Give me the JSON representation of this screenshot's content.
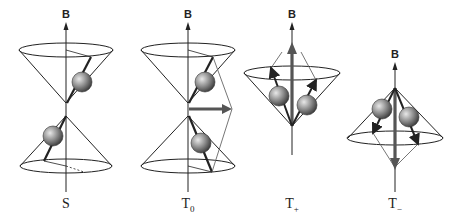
{
  "field_label": "B",
  "panels": [
    {
      "id": "S",
      "label_main": "S",
      "label_sub": "",
      "x": 66
    },
    {
      "id": "T0",
      "label_main": "T",
      "label_sub": "0",
      "x": 188
    },
    {
      "id": "Tplus",
      "label_main": "T",
      "label_sub": "+",
      "x": 292
    },
    {
      "id": "Tminus",
      "label_main": "T",
      "label_sub": "−",
      "x": 395
    }
  ]
}
